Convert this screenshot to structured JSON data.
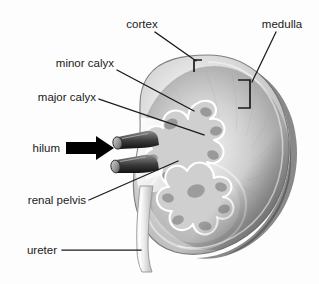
{
  "figure": {
    "kind": "anatomical-diagram",
    "background_color": "#fdfdfd",
    "line_color": "#1a1a1a",
    "label_color": "#1a1a1a"
  },
  "labels": {
    "cortex": "cortex",
    "medulla": "medulla",
    "minor_calyx": "minor calyx",
    "major_calyx": "major calyx",
    "hilum": "hilum",
    "renal_pelvis": "renal pelvis",
    "ureter": "ureter"
  },
  "annotations": [
    {
      "id": "cortex",
      "label": "cortex",
      "label_anchor": "middle",
      "text_x": 142,
      "text_y": 27,
      "leader": {
        "x1": 155,
        "y1": 32,
        "x2": 196,
        "y2": 62
      },
      "marker": "bracket-left",
      "marker_box": {
        "x": 193,
        "y": 60,
        "width": 9,
        "height": 12
      }
    },
    {
      "id": "medulla",
      "label": "medulla",
      "label_anchor": "middle",
      "text_x": 282,
      "text_y": 27,
      "leader": {
        "x1": 276,
        "y1": 32,
        "x2": 253,
        "y2": 82
      },
      "marker": "bracket-right",
      "marker_box": {
        "x": 238,
        "y": 80,
        "width": 12,
        "height": 28
      }
    },
    {
      "id": "minor-calyx",
      "label": "minor calyx",
      "label_anchor": "end",
      "text_x": 114,
      "text_y": 66,
      "leader": {
        "x1": 117,
        "y1": 70,
        "x2": 194,
        "y2": 111
      }
    },
    {
      "id": "major-calyx",
      "label": "major calyx",
      "label_anchor": "end",
      "text_x": 96,
      "text_y": 99,
      "leader": {
        "x1": 99,
        "y1": 99,
        "x2": 204,
        "y2": 135
      }
    },
    {
      "id": "hilum",
      "label": "hilum",
      "label_anchor": "end",
      "text_x": 58,
      "text_y": 148,
      "leader": null,
      "marker": "block-arrow-right",
      "arrow": {
        "x": 66,
        "y": 137,
        "width": 50,
        "height": 22
      }
    },
    {
      "id": "renal-pelvis",
      "label": "renal pelvis",
      "label_anchor": "end",
      "text_x": 86,
      "text_y": 203,
      "leader": {
        "x1": 89,
        "y1": 200,
        "x2": 178,
        "y2": 161
      }
    },
    {
      "id": "ureter",
      "label": "ureter",
      "label_anchor": "end",
      "text_x": 56,
      "text_y": 254,
      "leader": {
        "x1": 62,
        "y1": 250,
        "x2": 140,
        "y2": 250
      }
    }
  ],
  "structures": [
    {
      "id": "kidney-body",
      "name": "kidney-outline"
    },
    {
      "id": "kidney-shadow",
      "name": "kidney-drop-shadow"
    },
    {
      "id": "renal-cortex",
      "name": "cortex-region"
    },
    {
      "id": "renal-medulla",
      "name": "medulla-region"
    },
    {
      "id": "renal-sinus",
      "name": "renal-pelvis-region"
    },
    {
      "id": "calyces-upper",
      "name": "upper-calyces-cluster"
    },
    {
      "id": "calyces-lower",
      "name": "lower-calyces-cluster"
    },
    {
      "id": "renal-vessel-upper",
      "name": "renal-artery-tube"
    },
    {
      "id": "renal-vessel-lower",
      "name": "renal-vein-tube"
    },
    {
      "id": "ureter-tube",
      "name": "ureter-tube"
    }
  ]
}
